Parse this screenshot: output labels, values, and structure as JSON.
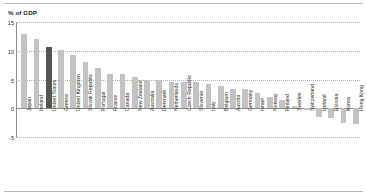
{
  "chart_data": {
    "type": "bar",
    "title": "",
    "xlabel": "",
    "ylabel": "% of GDP",
    "ylim": [
      -5,
      15
    ],
    "yticks": [
      15,
      10,
      5,
      0,
      -5
    ],
    "ytick_labels": [
      "15",
      "10",
      "5",
      "0",
      "-5"
    ],
    "grid": true,
    "legend": null,
    "highlight_category": "United States",
    "colors": {
      "bar": "#c3c3c3",
      "highlight_bar": "#555555",
      "gridline": "#b0b0b0",
      "axis": "#8d8d8d",
      "text": "#1a1a1a"
    },
    "categories": [
      "Japan",
      "Ireland",
      "United States",
      "Greece",
      "United Kingdom",
      "Slovak Republic",
      "Portugal",
      "France",
      "Canada",
      "New Zealand",
      "Australia",
      "Denmark",
      "Netherlands",
      "Czech Republic",
      "Slovenia",
      "Italy",
      "Belgium",
      "Austria",
      "Germany",
      "Israel",
      "Norway",
      "Finland",
      "Sweden",
      "Switzerland",
      "Iceland",
      "Estonia",
      "Korea",
      "Hong Kong"
    ],
    "values": [
      12.9,
      12.0,
      10.6,
      10.2,
      9.2,
      8.0,
      7.0,
      6.0,
      6.0,
      5.4,
      4.9,
      4.9,
      4.6,
      4.6,
      4.5,
      4.2,
      3.9,
      3.4,
      3.3,
      2.7,
      1.9,
      1.4,
      0.4,
      -0.3,
      -1.6,
      -1.7,
      -2.6,
      -2.8
    ]
  },
  "axis_title": {
    "text": "% of GDP"
  }
}
